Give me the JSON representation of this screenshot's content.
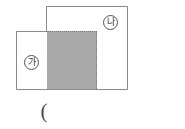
{
  "figure": {
    "background_color": "#ffffff",
    "width": 185,
    "height": 129,
    "shapes": {
      "rect_na": {
        "label": "나",
        "circled_label": "㊜",
        "fill_color": "#ffffff",
        "border_color": "#8c8c8c",
        "x": 46,
        "y": 6,
        "width": 82,
        "height": 84
      },
      "rect_ga": {
        "label": "가",
        "circled_label": "㉮",
        "fill_color": "#ffffff",
        "border_color": "#8c8c8c",
        "x": 16,
        "y": 31,
        "width": 81,
        "height": 59
      },
      "overlap": {
        "fill_color": "#a8a8a8",
        "edge_style": "dotted",
        "x": 47,
        "y": 31,
        "width": 50,
        "height": 58
      }
    },
    "labels": {
      "na": "나",
      "ga": "가"
    },
    "caption": {
      "paren": "("
    }
  }
}
